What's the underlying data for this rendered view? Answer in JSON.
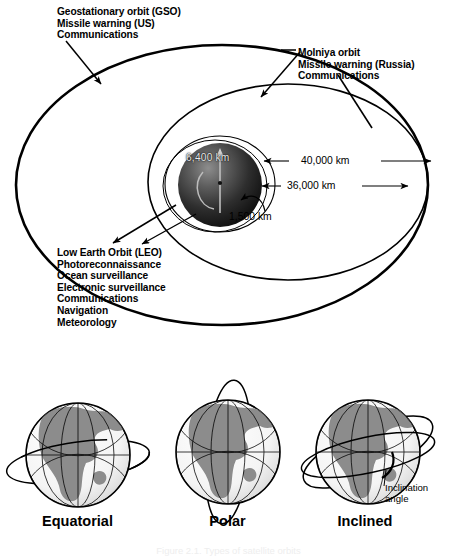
{
  "figure": {
    "caption": "Figure 2.1. Types of satellite orbits"
  },
  "orbit_panel": {
    "gso_label": "Geostationary orbit (GSO)\nMissile warning (US)\nCommunications",
    "molniya_label": "Molniya orbit\nMissile warning (Russia)\nCommunications",
    "leo_label": "Low Earth Orbit (LEO)\nPhotoreconnaissance\nOcean surveillance\nElectronic surveillance\nCommunications\nNavigation\nMeteorology",
    "dimensions": {
      "earth_radius": "6,400 km",
      "gso_altitude": "36,000 km",
      "molniya_apogee": "40,000 km",
      "leo_altitude": "1,500 km"
    }
  },
  "inclination_panel": {
    "globes": [
      {
        "name": "Equatorial"
      },
      {
        "name": "Polar"
      },
      {
        "name": "Inclined"
      }
    ],
    "annotation": "Inclination\nangle"
  },
  "colors": {
    "ink": "#000000",
    "land": "#8c8c8c",
    "ocean": "#f2f2f2",
    "earth_dark": "#1a1a1a",
    "background": "#ffffff"
  }
}
